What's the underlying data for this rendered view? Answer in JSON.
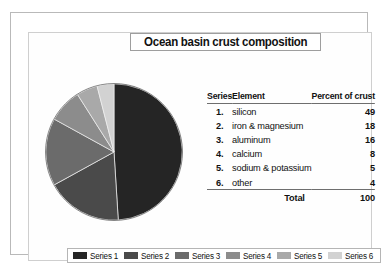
{
  "chart_data": {
    "type": "pie",
    "title": "Ocean basin crust composition",
    "categories": [
      "silicon",
      "iron & magnesium",
      "aluminum",
      "calcium",
      "sodium & potassium",
      "other"
    ],
    "values": [
      49,
      18,
      16,
      8,
      5,
      4
    ],
    "series_names": [
      "Series 1",
      "Series 2",
      "Series 3",
      "Series 4",
      "Series 5",
      "Series 6"
    ],
    "colors": [
      "#252525",
      "#4a4a4a",
      "#6b6b6b",
      "#8c8c8c",
      "#a9a9a9",
      "#d2d2d2"
    ],
    "unit": "Percent of crust",
    "total": 100,
    "start_angle_deg": 0,
    "direction": "clockwise",
    "legend_position": "bottom",
    "grid": false,
    "xlabel": "",
    "ylabel": ""
  },
  "title": {
    "text": "Ocean basin crust composition"
  },
  "table": {
    "headers": {
      "series": "Series",
      "element": "Element",
      "percent": "Percent of crust"
    },
    "rows": [
      {
        "index": "1.",
        "element": "silicon",
        "percent": "49"
      },
      {
        "index": "2.",
        "element": "iron & magnesium",
        "percent": "18"
      },
      {
        "index": "3.",
        "element": "aluminum",
        "percent": "16"
      },
      {
        "index": "4.",
        "element": "calcium",
        "percent": "8"
      },
      {
        "index": "5.",
        "element": "sodium & potassium",
        "percent": "5"
      },
      {
        "index": "6.",
        "element": "other",
        "percent": "4"
      }
    ],
    "total": {
      "label": "Total",
      "value": "100"
    }
  },
  "legend": {
    "items": [
      {
        "label": "Series 1",
        "color": "#252525"
      },
      {
        "label": "Series 2",
        "color": "#4a4a4a"
      },
      {
        "label": "Series 3",
        "color": "#6b6b6b"
      },
      {
        "label": "Series 4",
        "color": "#8c8c8c"
      },
      {
        "label": "Series 5",
        "color": "#a9a9a9"
      },
      {
        "label": "Series 6",
        "color": "#d2d2d2"
      }
    ]
  }
}
